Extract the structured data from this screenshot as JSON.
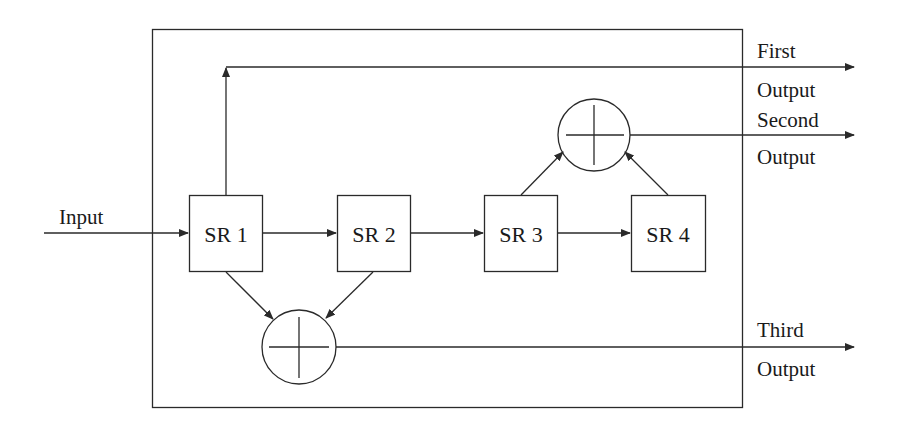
{
  "diagram": {
    "type": "block-diagram",
    "input_label": "Input",
    "blocks": [
      {
        "id": "sr1",
        "label": "SR 1"
      },
      {
        "id": "sr2",
        "label": "SR 2"
      },
      {
        "id": "sr3",
        "label": "SR 3"
      },
      {
        "id": "sr4",
        "label": "SR 4"
      }
    ],
    "adders": [
      {
        "id": "adder-top",
        "inputs": [
          "SR 3",
          "SR 4"
        ],
        "output": "Second Output"
      },
      {
        "id": "adder-bottom",
        "inputs": [
          "SR 1",
          "SR 2"
        ],
        "output": "Third Output"
      }
    ],
    "outputs": {
      "first": {
        "line1": "First",
        "line2": "Output",
        "source": "SR 1"
      },
      "second": {
        "line1": "Second",
        "line2": "Output",
        "source": "adder-top"
      },
      "third": {
        "line1": "Third",
        "line2": "Output",
        "source": "adder-bottom"
      }
    },
    "connections": [
      "Input -> SR 1",
      "SR 1 -> SR 2",
      "SR 2 -> SR 3",
      "SR 3 -> SR 4",
      "SR 1 -> First Output",
      "SR 3 -> adder-top",
      "SR 4 -> adder-top",
      "adder-top -> Second Output",
      "SR 1 -> adder-bottom",
      "SR 2 -> adder-bottom",
      "adder-bottom -> Third Output"
    ]
  }
}
